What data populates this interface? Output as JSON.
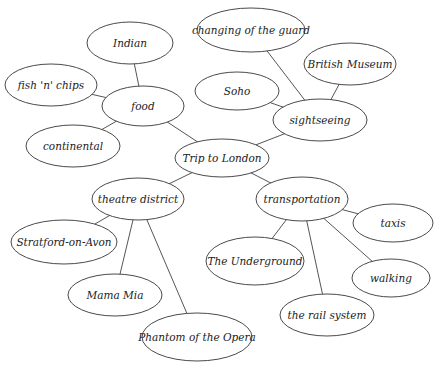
{
  "diagram": {
    "type": "mind-map",
    "colors": {
      "background": "#ffffff",
      "stroke": "#4a4a4a",
      "text": "#222222"
    },
    "nodes": [
      {
        "id": "root",
        "label": "Trip to London",
        "cx": 222,
        "cy": 158,
        "rx": 47,
        "ry": 19
      },
      {
        "id": "food",
        "label": "food",
        "cx": 143,
        "cy": 106,
        "rx": 41,
        "ry": 20
      },
      {
        "id": "indian",
        "label": "Indian",
        "cx": 130,
        "cy": 43,
        "rx": 43,
        "ry": 21
      },
      {
        "id": "fish",
        "label": "fish 'n' chips",
        "cx": 51,
        "cy": 85,
        "rx": 46,
        "ry": 21
      },
      {
        "id": "continental",
        "label": "continental",
        "cx": 73,
        "cy": 146,
        "rx": 47,
        "ry": 21
      },
      {
        "id": "sightseeing",
        "label": "sightseeing",
        "cx": 320,
        "cy": 120,
        "rx": 47,
        "ry": 21
      },
      {
        "id": "guard",
        "label": "changing of the guard",
        "cx": 251,
        "cy": 30,
        "rx": 54,
        "ry": 22
      },
      {
        "id": "museum",
        "label": "British Museum",
        "cx": 350,
        "cy": 64,
        "rx": 46,
        "ry": 21
      },
      {
        "id": "soho",
        "label": "Soho",
        "cx": 237,
        "cy": 91,
        "rx": 42,
        "ry": 19
      },
      {
        "id": "theatre",
        "label": "theatre district",
        "cx": 138,
        "cy": 199,
        "rx": 46,
        "ry": 21
      },
      {
        "id": "stratford",
        "label": "Stratford-on-Avon",
        "cx": 64,
        "cy": 242,
        "rx": 53,
        "ry": 22
      },
      {
        "id": "mamamia",
        "label": "Mama Mia",
        "cx": 115,
        "cy": 295,
        "rx": 47,
        "ry": 21
      },
      {
        "id": "phantom",
        "label": "Phantom of the Opera",
        "cx": 197,
        "cy": 337,
        "rx": 55,
        "ry": 24
      },
      {
        "id": "transport",
        "label": "transportation",
        "cx": 302,
        "cy": 199,
        "rx": 46,
        "ry": 22
      },
      {
        "id": "taxis",
        "label": "taxis",
        "cx": 393,
        "cy": 223,
        "rx": 40,
        "ry": 19
      },
      {
        "id": "underground",
        "label": "The Underground",
        "cx": 255,
        "cy": 261,
        "rx": 49,
        "ry": 24
      },
      {
        "id": "walking",
        "label": "walking",
        "cx": 391,
        "cy": 278,
        "rx": 39,
        "ry": 19
      },
      {
        "id": "rail",
        "label": "the rail system",
        "cx": 327,
        "cy": 315,
        "rx": 47,
        "ry": 21
      }
    ],
    "edges": [
      [
        "root",
        "food"
      ],
      [
        "root",
        "sightseeing"
      ],
      [
        "root",
        "theatre"
      ],
      [
        "root",
        "transport"
      ],
      [
        "food",
        "indian"
      ],
      [
        "food",
        "fish"
      ],
      [
        "food",
        "continental"
      ],
      [
        "sightseeing",
        "guard"
      ],
      [
        "sightseeing",
        "museum"
      ],
      [
        "sightseeing",
        "soho"
      ],
      [
        "theatre",
        "stratford"
      ],
      [
        "theatre",
        "mamamia"
      ],
      [
        "theatre",
        "phantom"
      ],
      [
        "transport",
        "taxis"
      ],
      [
        "transport",
        "underground"
      ],
      [
        "transport",
        "walking"
      ],
      [
        "transport",
        "rail"
      ]
    ]
  }
}
